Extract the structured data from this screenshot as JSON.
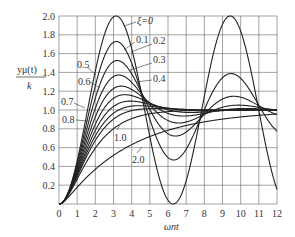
{
  "chart_data": {
    "type": "line",
    "title": "",
    "xlabel": "ωnt",
    "ylabel": "yμ(t) / k",
    "xlim": [
      0,
      12
    ],
    "ylim": [
      0,
      2.0
    ],
    "grid": true,
    "x_ticks": [
      "0",
      "1",
      "2",
      "3",
      "4",
      "5",
      "6",
      "7",
      "8",
      "9",
      "10",
      "11",
      "12"
    ],
    "y_ticks": [
      "0.2",
      "0.4",
      "0.6",
      "0.8",
      "1.0",
      "1.2",
      "1.4",
      "1.6",
      "1.8",
      "2.0"
    ],
    "series_param": "ξ",
    "series": [
      {
        "name": "ξ=0",
        "zeta": 0,
        "peak": 2.0,
        "peak_x": 3.14
      },
      {
        "name": "0.1",
        "zeta": 0.1,
        "peak": 1.73,
        "peak_x": 3.16
      },
      {
        "name": "0.2",
        "zeta": 0.2,
        "peak": 1.53,
        "peak_x": 3.21
      },
      {
        "name": "0.3",
        "zeta": 0.3,
        "peak": 1.37,
        "peak_x": 3.29
      },
      {
        "name": "0.4",
        "zeta": 0.4,
        "peak": 1.25,
        "peak_x": 3.43
      },
      {
        "name": "0.5",
        "zeta": 0.5,
        "peak": 1.16,
        "peak_x": 3.63
      },
      {
        "name": "0.6",
        "zeta": 0.6,
        "peak": 1.09,
        "peak_x": 3.93
      },
      {
        "name": "0.7",
        "zeta": 0.7,
        "peak": 1.05,
        "peak_x": 4.4
      },
      {
        "name": "0.8",
        "zeta": 0.8,
        "peak": 1.02,
        "peak_x": 5.24
      },
      {
        "name": "1.0",
        "zeta": 1.0,
        "peak": 1.0,
        "peak_x": null
      },
      {
        "name": "2.0",
        "zeta": 2.0,
        "peak": 1.0,
        "peak_x": null
      }
    ],
    "legend_position": "inline labels"
  },
  "labels": {
    "ylabel_num": "yμ(t)",
    "ylabel_den": "k",
    "xlabel": "ωnt",
    "xi0": "ξ=0",
    "z01": "0.1",
    "z02": "0.2",
    "z03": "0.3",
    "z04": "0.4",
    "z05": "0.5",
    "z06": "0.6",
    "z07": "0.7",
    "z08": "0.8",
    "z10": "1.0",
    "z20": "2.0"
  }
}
